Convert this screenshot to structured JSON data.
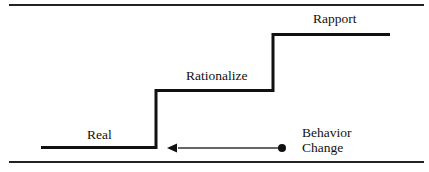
{
  "diagram": {
    "type": "staircase",
    "steps": [
      {
        "label": "Real",
        "level": 1
      },
      {
        "label": "Rationalize",
        "level": 2
      },
      {
        "label": "Rapport",
        "level": 3
      }
    ],
    "arrow": {
      "label_line1": "Behavior",
      "label_line2": "Change",
      "direction": "left"
    }
  }
}
